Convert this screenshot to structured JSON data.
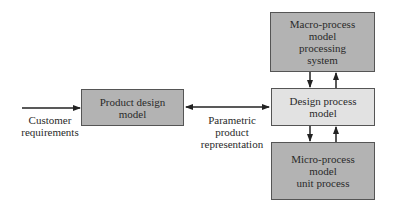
{
  "diagram": {
    "nodes": {
      "product_design": {
        "lines": [
          "Product design",
          "model"
        ],
        "fill": "#b3b3b3"
      },
      "macro_process": {
        "lines": [
          "Macro-process",
          "model",
          "processing",
          "system"
        ],
        "fill": "#b3b3b3"
      },
      "design_process": {
        "lines": [
          "Design process",
          "model"
        ],
        "fill": "#e2e2e2"
      },
      "micro_process": {
        "lines": [
          "Micro-process",
          "model",
          "unit process"
        ],
        "fill": "#b3b3b3"
      }
    },
    "labels": {
      "customer_requirements": [
        "Customer",
        "requirements"
      ],
      "parametric_product": [
        "Parametric",
        "product",
        "representation"
      ]
    },
    "edges": [
      {
        "from": "customer_requirements",
        "to": "product_design",
        "type": "single"
      },
      {
        "from": "product_design",
        "to": "design_process",
        "type": "bidirectional",
        "label": "parametric_product"
      },
      {
        "from": "macro_process",
        "to": "design_process",
        "type": "single"
      },
      {
        "from": "design_process",
        "to": "macro_process",
        "type": "single"
      },
      {
        "from": "design_process",
        "to": "micro_process",
        "type": "single"
      },
      {
        "from": "micro_process",
        "to": "design_process",
        "type": "single"
      }
    ]
  }
}
